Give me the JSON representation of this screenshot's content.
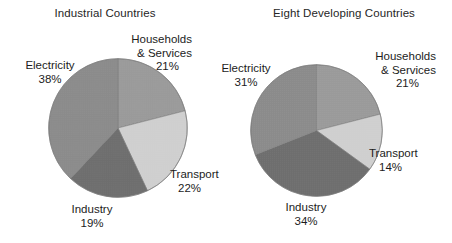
{
  "chart_data": [
    {
      "type": "pie",
      "title": "Industrial Countries",
      "categories": [
        "Households & Services",
        "Transport",
        "Industry",
        "Electricity"
      ],
      "values": [
        21,
        22,
        19,
        38
      ],
      "value_suffix": "%",
      "start_angle_deg": 0,
      "direction": "clockwise",
      "legend": "none",
      "labels": [
        {
          "name": "Households & Services",
          "line1": "Households",
          "line2": "& Services",
          "pct": "21%",
          "color": "#9a9a9a"
        },
        {
          "name": "Transport",
          "line1": "Transport",
          "line2": "",
          "pct": "22%",
          "color": "#cfcfcf"
        },
        {
          "name": "Industry",
          "line1": "Industry",
          "line2": "",
          "pct": "19%",
          "color": "#6e6e6e"
        },
        {
          "name": "Electricity",
          "line1": "Electricity",
          "line2": "",
          "pct": "38%",
          "color": "#8b8b8b"
        }
      ]
    },
    {
      "type": "pie",
      "title": "Eight Developing Countries",
      "categories": [
        "Households & Services",
        "Transport",
        "Industry",
        "Electricity"
      ],
      "values": [
        21,
        14,
        34,
        31
      ],
      "value_suffix": "%",
      "start_angle_deg": 0,
      "direction": "clockwise",
      "legend": "none",
      "labels": [
        {
          "name": "Households & Services",
          "line1": "Households",
          "line2": "& Services",
          "pct": "21%",
          "color": "#9a9a9a"
        },
        {
          "name": "Transport",
          "line1": "Transport",
          "line2": "",
          "pct": "14%",
          "color": "#cfcfcf"
        },
        {
          "name": "Industry",
          "line1": "Industry",
          "line2": "",
          "pct": "34%",
          "color": "#6e6e6e"
        },
        {
          "name": "Electricity",
          "line1": "Electricity",
          "line2": "",
          "pct": "31%",
          "color": "#8b8b8b"
        }
      ]
    }
  ],
  "palette": {
    "households": "#9a9a9a",
    "transport": "#cfcfcf",
    "industry": "#6e6e6e",
    "electricity": "#8b8b8b",
    "outline": "#7a7a7a",
    "background": "#ffffff",
    "text": "#1c1c1c"
  }
}
